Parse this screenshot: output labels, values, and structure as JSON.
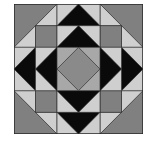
{
  "figure": {
    "type": "quilt-block",
    "grid": 6,
    "colors": {
      "dark": "#0a0a0a",
      "medium": "#808080",
      "light": "#cfcfcf",
      "center_light": "#a8a8a8",
      "center_diamond": "#8a8a8a",
      "outline": "#2a2a2a"
    },
    "pieces": [
      {
        "name": "corner-big-triangle-top-left",
        "color": "medium",
        "pts": [
          [
            0,
            0
          ],
          [
            2,
            0
          ],
          [
            0,
            2
          ]
        ]
      },
      {
        "name": "corner-light-triangle-top-left-a",
        "color": "light",
        "pts": [
          [
            2,
            0
          ],
          [
            2,
            1
          ],
          [
            1,
            1
          ]
        ]
      },
      {
        "name": "corner-light-triangle-top-left-b",
        "color": "light",
        "pts": [
          [
            0,
            2
          ],
          [
            1,
            1
          ],
          [
            1,
            2
          ]
        ]
      },
      {
        "name": "corner-square-top-left",
        "color": "medium",
        "pts": [
          [
            1,
            1
          ],
          [
            2,
            1
          ],
          [
            2,
            2
          ],
          [
            1,
            2
          ]
        ]
      },
      {
        "name": "corner-big-triangle-top-right",
        "color": "medium",
        "pts": [
          [
            6,
            0
          ],
          [
            4,
            0
          ],
          [
            6,
            2
          ]
        ]
      },
      {
        "name": "corner-light-triangle-top-right-a",
        "color": "light",
        "pts": [
          [
            4,
            0
          ],
          [
            4,
            1
          ],
          [
            5,
            1
          ]
        ]
      },
      {
        "name": "corner-light-triangle-top-right-b",
        "color": "light",
        "pts": [
          [
            6,
            2
          ],
          [
            5,
            1
          ],
          [
            5,
            2
          ]
        ]
      },
      {
        "name": "corner-square-top-right",
        "color": "medium",
        "pts": [
          [
            4,
            1
          ],
          [
            5,
            1
          ],
          [
            5,
            2
          ],
          [
            4,
            2
          ]
        ]
      },
      {
        "name": "corner-big-triangle-bottom-left",
        "color": "medium",
        "pts": [
          [
            0,
            6
          ],
          [
            2,
            6
          ],
          [
            0,
            4
          ]
        ]
      },
      {
        "name": "corner-light-triangle-bottom-left-a",
        "color": "light",
        "pts": [
          [
            2,
            6
          ],
          [
            2,
            5
          ],
          [
            1,
            5
          ]
        ]
      },
      {
        "name": "corner-light-triangle-bottom-left-b",
        "color": "light",
        "pts": [
          [
            0,
            4
          ],
          [
            1,
            5
          ],
          [
            1,
            4
          ]
        ]
      },
      {
        "name": "corner-square-bottom-left",
        "color": "medium",
        "pts": [
          [
            1,
            4
          ],
          [
            2,
            4
          ],
          [
            2,
            5
          ],
          [
            1,
            5
          ]
        ]
      },
      {
        "name": "corner-big-triangle-bottom-right",
        "color": "medium",
        "pts": [
          [
            6,
            6
          ],
          [
            4,
            6
          ],
          [
            6,
            4
          ]
        ]
      },
      {
        "name": "corner-light-triangle-bottom-right-a",
        "color": "light",
        "pts": [
          [
            4,
            6
          ],
          [
            4,
            5
          ],
          [
            5,
            5
          ]
        ]
      },
      {
        "name": "corner-light-triangle-bottom-right-b",
        "color": "light",
        "pts": [
          [
            6,
            4
          ],
          [
            5,
            5
          ],
          [
            5,
            4
          ]
        ]
      },
      {
        "name": "corner-square-bottom-right",
        "color": "medium",
        "pts": [
          [
            4,
            4
          ],
          [
            5,
            4
          ],
          [
            5,
            5
          ],
          [
            4,
            5
          ]
        ]
      },
      {
        "name": "top-light-bg-row0",
        "color": "light",
        "pts": [
          [
            2,
            0
          ],
          [
            4,
            0
          ],
          [
            4,
            1
          ],
          [
            2,
            1
          ]
        ]
      },
      {
        "name": "top-black-triangle-outer",
        "color": "dark",
        "pts": [
          [
            3,
            0
          ],
          [
            4,
            1
          ],
          [
            2,
            1
          ]
        ]
      },
      {
        "name": "top-light-bg-row1",
        "color": "light",
        "pts": [
          [
            2,
            1
          ],
          [
            4,
            1
          ],
          [
            4,
            2
          ],
          [
            2,
            2
          ]
        ]
      },
      {
        "name": "top-black-triangle-inner",
        "color": "dark",
        "pts": [
          [
            3,
            1
          ],
          [
            4,
            2
          ],
          [
            2,
            2
          ]
        ]
      },
      {
        "name": "bottom-light-bg-row5",
        "color": "light",
        "pts": [
          [
            2,
            5
          ],
          [
            4,
            5
          ],
          [
            4,
            6
          ],
          [
            2,
            6
          ]
        ]
      },
      {
        "name": "bottom-black-triangle-outer",
        "color": "dark",
        "pts": [
          [
            3,
            6
          ],
          [
            4,
            5
          ],
          [
            2,
            5
          ]
        ]
      },
      {
        "name": "bottom-light-bg-row4",
        "color": "light",
        "pts": [
          [
            2,
            4
          ],
          [
            4,
            4
          ],
          [
            4,
            5
          ],
          [
            2,
            5
          ]
        ]
      },
      {
        "name": "bottom-black-triangle-inner",
        "color": "dark",
        "pts": [
          [
            3,
            5
          ],
          [
            4,
            4
          ],
          [
            2,
            4
          ]
        ]
      },
      {
        "name": "left-light-bg-col0",
        "color": "light",
        "pts": [
          [
            0,
            2
          ],
          [
            1,
            2
          ],
          [
            1,
            4
          ],
          [
            0,
            4
          ]
        ]
      },
      {
        "name": "left-black-triangle-outer",
        "color": "dark",
        "pts": [
          [
            0,
            3
          ],
          [
            1,
            2
          ],
          [
            1,
            4
          ]
        ]
      },
      {
        "name": "left-light-bg-col1",
        "color": "light",
        "pts": [
          [
            1,
            2
          ],
          [
            2,
            2
          ],
          [
            2,
            4
          ],
          [
            1,
            4
          ]
        ]
      },
      {
        "name": "left-black-triangle-inner",
        "color": "dark",
        "pts": [
          [
            1,
            3
          ],
          [
            2,
            2
          ],
          [
            2,
            4
          ]
        ]
      },
      {
        "name": "right-light-bg-col5",
        "color": "light",
        "pts": [
          [
            5,
            2
          ],
          [
            6,
            2
          ],
          [
            6,
            4
          ],
          [
            5,
            4
          ]
        ]
      },
      {
        "name": "right-black-triangle-outer",
        "color": "dark",
        "pts": [
          [
            6,
            3
          ],
          [
            5,
            2
          ],
          [
            5,
            4
          ]
        ]
      },
      {
        "name": "right-light-bg-col4",
        "color": "light",
        "pts": [
          [
            4,
            2
          ],
          [
            5,
            2
          ],
          [
            5,
            4
          ],
          [
            4,
            4
          ]
        ]
      },
      {
        "name": "right-black-triangle-inner",
        "color": "dark",
        "pts": [
          [
            5,
            3
          ],
          [
            4,
            2
          ],
          [
            4,
            4
          ]
        ]
      },
      {
        "name": "center-square",
        "color": "center_light",
        "pts": [
          [
            2,
            2
          ],
          [
            4,
            2
          ],
          [
            4,
            4
          ],
          [
            2,
            4
          ]
        ]
      },
      {
        "name": "center-diamond",
        "color": "center_diamond",
        "pts": [
          [
            3,
            2
          ],
          [
            4,
            3
          ],
          [
            3,
            4
          ],
          [
            2,
            3
          ]
        ]
      }
    ]
  }
}
